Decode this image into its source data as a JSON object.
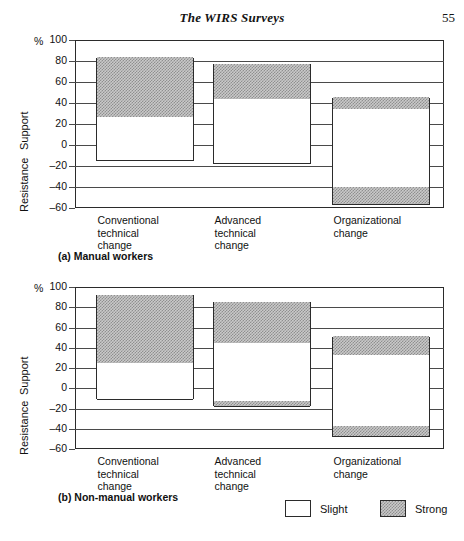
{
  "runhead": {
    "title": "The WIRS Surveys",
    "page_number": "55"
  },
  "axis": {
    "percent_symbol": "%",
    "support_label": "Support",
    "resistance_label": "Resistance",
    "ticks": [
      "100",
      "80",
      "60",
      "40",
      "20",
      "0",
      "–20",
      "–40",
      "–60"
    ]
  },
  "categories": [
    "Conventional\ntechnical\nchange",
    "Advanced\ntechnical\nchange",
    "Organizational\nchange"
  ],
  "panels": [
    {
      "caption": "(a)  Manual workers"
    },
    {
      "caption": "(b)  Non-manual workers"
    }
  ],
  "legend": {
    "items": [
      {
        "label": "Slight",
        "fill": "white"
      },
      {
        "label": "Strong",
        "fill": "shaded"
      }
    ]
  },
  "colors": {
    "ink": "#111111",
    "rule": "#4a4a4a",
    "bar_outline": "#2b2b2b",
    "strong_fill": "#c9c9c9",
    "slight_fill": "#ffffff",
    "background": "#ffffff"
  },
  "chart_data": {
    "type": "bar",
    "title": "The WIRS Surveys",
    "xlabel": "",
    "ylabel": "%",
    "ylim": [
      -60,
      100
    ],
    "ytick_step": 20,
    "grid": true,
    "legend_position": "bottom-right",
    "axis_regions": [
      {
        "name": "Support",
        "range": [
          0,
          100
        ]
      },
      {
        "name": "Resistance",
        "range": [
          -60,
          0
        ]
      }
    ],
    "panels": [
      {
        "key": "a",
        "caption": "(a)  Manual workers",
        "categories": [
          "Conventional technical change",
          "Advanced technical change",
          "Organizational change"
        ],
        "series": [
          {
            "name": "Support Strong",
            "values": [
              57,
              34,
              11
            ]
          },
          {
            "name": "Support Slight",
            "values": [
              26,
              43,
              34
            ]
          },
          {
            "name": "Resistance Slight",
            "values": [
              -15,
              -18,
              -40
            ]
          },
          {
            "name": "Resistance Strong",
            "values": [
              0,
              0,
              -17
            ]
          }
        ],
        "bar_totals": {
          "support_top": [
            83,
            77,
            45
          ],
          "support_slight_boundary": [
            26,
            43,
            34
          ],
          "resistance_bottom": [
            -15,
            -18,
            -57
          ],
          "resistance_strong_start": [
            null,
            null,
            -40
          ]
        }
      },
      {
        "key": "b",
        "caption": "(b)  Non-manual workers",
        "categories": [
          "Conventional technical change",
          "Advanced technical change",
          "Organizational change"
        ],
        "series": [
          {
            "name": "Support Strong",
            "values": [
              68,
              41,
              19
            ]
          },
          {
            "name": "Support Slight",
            "values": [
              24,
              44,
              32
            ]
          },
          {
            "name": "Resistance Slight",
            "values": [
              -11,
              -13,
              -38
            ]
          },
          {
            "name": "Resistance Strong",
            "values": [
              0,
              -5,
              -10
            ]
          }
        ],
        "bar_totals": {
          "support_top": [
            92,
            85,
            51
          ],
          "support_slight_boundary": [
            24,
            44,
            32
          ],
          "resistance_bottom": [
            -11,
            -18,
            -48
          ],
          "resistance_strong_start": [
            null,
            -13,
            -38
          ]
        }
      }
    ]
  }
}
